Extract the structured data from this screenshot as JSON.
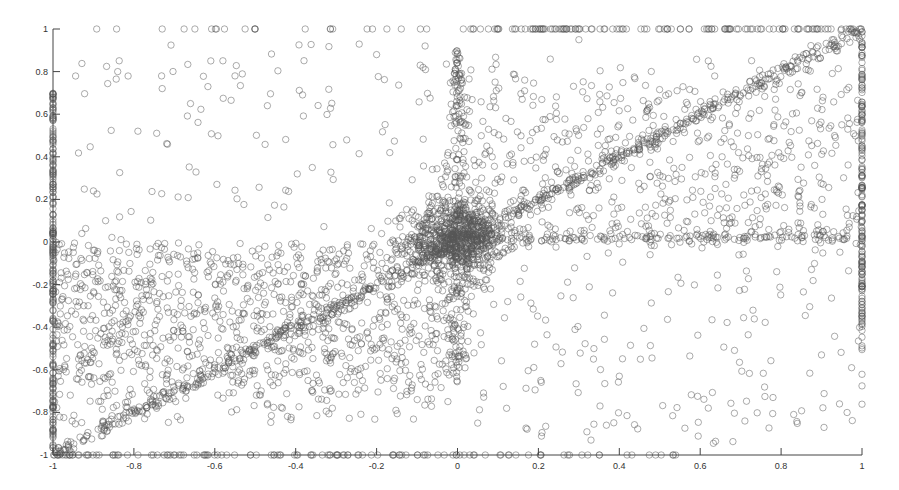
{
  "chart_data": {
    "type": "scatter",
    "title": "",
    "xlabel": "",
    "ylabel": "",
    "xlim": [
      -1,
      1
    ],
    "ylim": [
      -1,
      1
    ],
    "grid": false,
    "legend": null,
    "marker": "open-circle",
    "marker_color": "#555555",
    "x_ticks": [
      -1,
      -0.8,
      -0.6,
      -0.4,
      -0.2,
      0,
      0.2,
      0.4,
      0.6,
      0.8,
      1
    ],
    "x_tick_labels": [
      "-1",
      "-0.8",
      "-0.6",
      "-0.4",
      "-0.2",
      "0",
      "0.2",
      "0.4",
      "0.6",
      "0.8",
      "1"
    ],
    "y_ticks": [
      -1,
      -0.8,
      -0.6,
      -0.4,
      -0.2,
      0,
      0.2,
      0.4,
      0.6,
      0.8,
      1
    ],
    "y_tick_labels": [
      "-1",
      "-0.8",
      "-0.6",
      "-0.4",
      "-0.2",
      "0",
      "0.2",
      "0.4",
      "0.6",
      "0.8",
      "1"
    ],
    "components": [
      {
        "name": "diagonal y=x",
        "x_range": [
          -1,
          1
        ],
        "y_formula": "y = x",
        "noise_sd": 0.02,
        "count": 700
      },
      {
        "name": "origin cluster",
        "center": [
          0,
          0.02
        ],
        "sd": [
          0.06,
          0.08
        ],
        "count": 700
      },
      {
        "name": "lower-left cloud",
        "x_range": [
          -1,
          0
        ],
        "y_range": [
          -0.9,
          0.0
        ],
        "count": 1100
      },
      {
        "name": "upper-right cloud",
        "x_range": [
          0,
          1
        ],
        "y_range": [
          0.0,
          0.9
        ],
        "count": 600
      },
      {
        "name": "upper-left sparse",
        "x_range": [
          -0.95,
          0
        ],
        "y_range": [
          0.0,
          0.95
        ],
        "count": 110
      },
      {
        "name": "lower-right sparse",
        "x_range": [
          0,
          1
        ],
        "y_range": [
          -0.95,
          0
        ],
        "count": 170
      },
      {
        "name": "horizontal band y≈0",
        "x_range": [
          0,
          1
        ],
        "y_center": 0.02,
        "noise_sd": 0.015,
        "count": 160
      },
      {
        "name": "vertical band x≈0",
        "x_center": 0,
        "y_range": [
          -0.6,
          0.9
        ],
        "noise_sd": 0.03,
        "count": 250
      },
      {
        "name": "left border x=-1",
        "x": -1,
        "y_range": [
          -1,
          0.7
        ],
        "count": 220
      },
      {
        "name": "right border x=1",
        "x": 1,
        "y_range": [
          -0.4,
          1
        ],
        "count": 180
      },
      {
        "name": "right border sparse",
        "x": 1,
        "y_range": [
          -0.8,
          -0.4
        ],
        "count": 8
      },
      {
        "name": "top border y=1",
        "y": 1,
        "x_range": [
          -0.9,
          1
        ],
        "count": 150
      },
      {
        "name": "bottom border y=-1",
        "y": -1,
        "x_range": [
          -1,
          0.55
        ],
        "count": 130
      }
    ],
    "sample_points": [
      [
        -0.84,
        0.8
      ],
      [
        -0.73,
        0.72
      ],
      [
        -0.55,
        0.78
      ],
      [
        -0.66,
        0.65
      ],
      [
        -0.79,
        0.52
      ],
      [
        -0.47,
        0.64
      ],
      [
        -0.08,
        0.92
      ],
      [
        -0.2,
        0.88
      ],
      [
        0.3,
        0.95
      ],
      [
        0.62,
        0.85
      ],
      [
        0.85,
        0.7
      ],
      [
        0.95,
        0.55
      ],
      [
        0.4,
        -0.63
      ],
      [
        0.62,
        -0.78
      ],
      [
        0.78,
        -0.73
      ],
      [
        0.9,
        -0.53
      ],
      [
        0.05,
        -0.85
      ],
      [
        0.33,
        -0.93
      ],
      [
        -0.9,
        0.24
      ],
      [
        -0.87,
        0.1
      ]
    ]
  },
  "axes": {
    "x_origin_label": "-1",
    "y_bottom_label": "-1"
  }
}
